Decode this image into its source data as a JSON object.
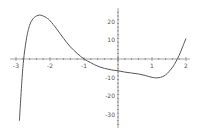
{
  "chart_data": {
    "type": "line",
    "title": "",
    "xlabel": "",
    "ylabel": "",
    "xlim": [
      -3,
      2
    ],
    "ylim": [
      -35,
      25
    ],
    "grid": false,
    "legend": null,
    "x_ticks": [
      -3,
      -2,
      -1,
      1,
      2
    ],
    "x_tick_labels": [
      "-3",
      "-2",
      "-1",
      "1",
      "2"
    ],
    "y_ticks": [
      20,
      10,
      -10,
      -20,
      -30
    ],
    "y_tick_labels": [
      "20",
      "10",
      "-10",
      "-20",
      "-30"
    ],
    "series": [
      {
        "name": "f(x)",
        "color": "#555555",
        "x": [
          -2.9,
          -2.8,
          -2.7,
          -2.6,
          -2.5,
          -2.4,
          -2.3,
          -2.2,
          -2.1,
          -2.0,
          -1.8,
          -1.6,
          -1.4,
          -1.2,
          -1.0,
          -0.8,
          -0.6,
          -0.4,
          -0.2,
          0.0,
          0.2,
          0.4,
          0.6,
          0.8,
          1.0,
          1.2,
          1.4,
          1.6,
          1.7,
          1.8,
          1.9,
          2.0
        ],
        "y": [
          -33,
          -5,
          10,
          18,
          21.5,
          23,
          23.5,
          23,
          22,
          20.5,
          16,
          11,
          6.5,
          3,
          0,
          -2,
          -3.8,
          -5,
          -5.8,
          -6.3,
          -7,
          -7.5,
          -8,
          -8.8,
          -9.8,
          -10,
          -8.5,
          -4.5,
          -1.5,
          2,
          6.5,
          11
        ]
      }
    ]
  }
}
